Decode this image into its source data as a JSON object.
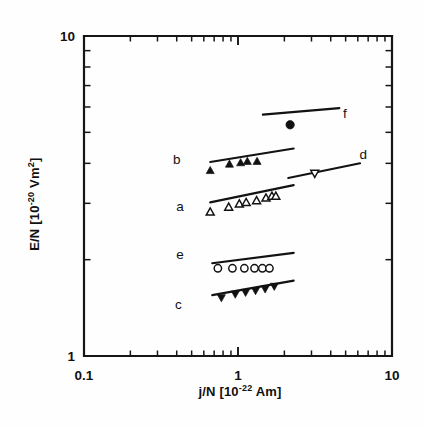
{
  "figure": {
    "background_color": "#fefefe",
    "ink_color": "#111111"
  },
  "axes": {
    "x": {
      "label_prefix": "j/N [10",
      "label_exponent": "-22",
      "label_suffix": " Am]",
      "label_full": "j/N [10-22 Am]",
      "scale": "log",
      "min": 0.1,
      "max": 10,
      "tick_labels": [
        "0.1",
        "1",
        "10"
      ],
      "tick_values": [
        0.1,
        1,
        10
      ],
      "pixel_min": 84,
      "pixel_max": 392
    },
    "y": {
      "label_prefix": "E/N [10",
      "label_exponent": "-20",
      "label_suffix": " Vm",
      "label_suffix_exponent": "2",
      "label_tail": "]",
      "label_full": "E/N [10-20 Vm2]",
      "scale": "log",
      "min": 1,
      "max": 10,
      "tick_labels": [
        "1",
        "10"
      ],
      "tick_values": [
        1,
        10
      ],
      "pixel_min": 356,
      "pixel_max": 36
    }
  },
  "chart_data": {
    "type": "scatter",
    "title": "",
    "subtitle": "",
    "xlabel": "j/N [10-22 Am]",
    "ylabel": "E/N [10-20 Vm2]",
    "xscale": "log",
    "yscale": "log",
    "xlim": [
      0.1,
      10
    ],
    "ylim": [
      1,
      10
    ],
    "grid": false,
    "legend": "inline-labels",
    "annotations": [
      "a",
      "b",
      "c",
      "d",
      "e",
      "f"
    ],
    "series": [
      {
        "name": "a",
        "label": "a",
        "marker": "open-triangle-up",
        "label_x": 0.42,
        "label_y": 2.95,
        "points": [
          {
            "x": 0.66,
            "y": 2.82
          },
          {
            "x": 0.87,
            "y": 2.92
          },
          {
            "x": 1.02,
            "y": 2.99
          },
          {
            "x": 1.13,
            "y": 3.02
          },
          {
            "x": 1.32,
            "y": 3.06
          },
          {
            "x": 1.52,
            "y": 3.12
          },
          {
            "x": 1.66,
            "y": 3.16
          },
          {
            "x": 1.76,
            "y": 3.16
          }
        ],
        "fit_line": {
          "x1": 0.66,
          "y1": 3.02,
          "x2": 2.3,
          "y2": 3.42
        }
      },
      {
        "name": "b",
        "label": "b",
        "marker": "filled-triangle-up",
        "label_x": 0.4,
        "label_y": 4.12,
        "points": [
          {
            "x": 0.66,
            "y": 3.8
          },
          {
            "x": 0.88,
            "y": 3.98
          },
          {
            "x": 1.04,
            "y": 4.02
          },
          {
            "x": 1.15,
            "y": 4.06
          },
          {
            "x": 1.33,
            "y": 4.06
          }
        ],
        "fit_line": {
          "x1": 0.66,
          "y1": 4.04,
          "x2": 2.3,
          "y2": 4.45
        }
      },
      {
        "name": "c",
        "label": "c",
        "marker": "filled-triangle-down",
        "label_x": 0.41,
        "label_y": 1.45,
        "points": [
          {
            "x": 0.78,
            "y": 1.52
          },
          {
            "x": 0.96,
            "y": 1.56
          },
          {
            "x": 1.12,
            "y": 1.58
          },
          {
            "x": 1.3,
            "y": 1.6
          },
          {
            "x": 1.5,
            "y": 1.62
          },
          {
            "x": 1.72,
            "y": 1.65
          }
        ],
        "fit_line": {
          "x1": 0.68,
          "y1": 1.55,
          "x2": 2.3,
          "y2": 1.72
        }
      },
      {
        "name": "d",
        "label": "d",
        "marker": "open-triangle-down",
        "label_x": 6.5,
        "label_y": 4.28,
        "points": [
          {
            "x": 3.15,
            "y": 3.72
          }
        ],
        "fit_line": {
          "x1": 2.12,
          "y1": 3.6,
          "x2": 6.2,
          "y2": 4.0
        }
      },
      {
        "name": "e",
        "label": "e",
        "marker": "open-circle",
        "label_x": 0.42,
        "label_y": 2.08,
        "points": [
          {
            "x": 0.74,
            "y": 1.88
          },
          {
            "x": 0.92,
            "y": 1.88
          },
          {
            "x": 1.1,
            "y": 1.88
          },
          {
            "x": 1.28,
            "y": 1.88
          },
          {
            "x": 1.44,
            "y": 1.88
          },
          {
            "x": 1.6,
            "y": 1.88
          }
        ],
        "fit_line": {
          "x1": 0.68,
          "y1": 1.95,
          "x2": 2.3,
          "y2": 2.1
        }
      },
      {
        "name": "f",
        "label": "f",
        "marker": "filled-circle",
        "label_x": 4.95,
        "label_y": 5.75,
        "points": [
          {
            "x": 2.18,
            "y": 5.28
          }
        ],
        "fit_line": {
          "x1": 1.45,
          "y1": 5.68,
          "x2": 4.55,
          "y2": 5.95
        }
      }
    ]
  }
}
